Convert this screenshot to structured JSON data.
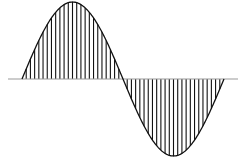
{
  "diagram": {
    "type": "sampled-sine-wave",
    "canvas": {
      "width": 239,
      "height": 162
    },
    "axis": {
      "x_start": 8,
      "x_end": 238,
      "y": 79,
      "color": "#999999",
      "stroke_width": 1
    },
    "wave": {
      "x_start": 22,
      "x_end": 224,
      "amplitude_px": 77,
      "baseline_y": 79,
      "cycles": 1,
      "curve_color": "#111111",
      "curve_width": 1.3
    },
    "hatching": {
      "lines_per_half_cycle": 23,
      "color": "#111111",
      "stroke_width": 1.1,
      "orientation": "vertical"
    },
    "colors": {
      "background": "#ffffff",
      "ink": "#111111",
      "axis": "#999999"
    }
  }
}
